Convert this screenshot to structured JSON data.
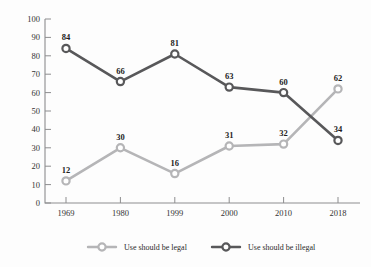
{
  "chart_data": {
    "type": "line",
    "title": "",
    "subtitle": "",
    "xlabel": "",
    "ylabel": "",
    "categories": [
      "1969",
      "1980",
      "1999",
      "2000",
      "2010",
      "2018"
    ],
    "ylim": [
      0,
      100
    ],
    "y_ticks": [
      "0",
      "10",
      "20",
      "30",
      "40",
      "50",
      "60",
      "70",
      "80",
      "90",
      "100"
    ],
    "grid": false,
    "legend_position": "bottom",
    "series": [
      {
        "name": "Use should be legal",
        "color": "#b5b5b7",
        "marker": "open-circle",
        "values": [
          12,
          30,
          16,
          31,
          32,
          62
        ],
        "labels": [
          "12",
          "30",
          "16",
          "31",
          "32",
          "62"
        ]
      },
      {
        "name": "Use should be illegal",
        "color": "#58585a",
        "marker": "open-circle",
        "values": [
          84,
          66,
          81,
          63,
          60,
          34
        ],
        "labels": [
          "84",
          "66",
          "81",
          "63",
          "60",
          "34"
        ]
      }
    ]
  },
  "legend": {
    "items": [
      {
        "label": "Use should be legal",
        "color": "#b5b5b7"
      },
      {
        "label": "Use should be illegal",
        "color": "#58585a"
      }
    ]
  },
  "axis": {
    "line_color": "#8d8d8f"
  }
}
